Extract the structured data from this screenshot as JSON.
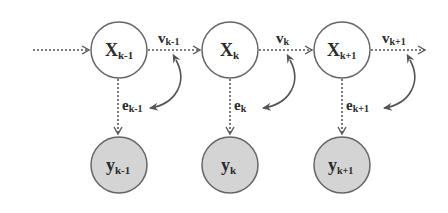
{
  "diagram": {
    "type": "state-space chain",
    "colors": {
      "background": "#ffffff",
      "stroke": "#555555",
      "text": "#2a2a2a",
      "observed_fill": "#d4d4d4",
      "state_fill": "#ffffff"
    },
    "state_nodes": [
      {
        "id": "x_km1",
        "base": "X",
        "sub": "k-1"
      },
      {
        "id": "x_k",
        "base": "X",
        "sub": "k"
      },
      {
        "id": "x_kp1",
        "base": "X",
        "sub": "k+1"
      }
    ],
    "observation_nodes": [
      {
        "id": "y_km1",
        "base": "y",
        "sub": "k-1"
      },
      {
        "id": "y_k",
        "base": "y",
        "sub": "k"
      },
      {
        "id": "y_kp1",
        "base": "y",
        "sub": "k+1"
      }
    ],
    "process_noise_labels": [
      {
        "base": "v",
        "sub": "k-1"
      },
      {
        "base": "v",
        "sub": "k"
      },
      {
        "base": "v",
        "sub": "k+1"
      }
    ],
    "measurement_noise_labels": [
      {
        "base": "e",
        "sub": "k-1"
      },
      {
        "base": "e",
        "sub": "k"
      },
      {
        "base": "e",
        "sub": "k+1"
      }
    ],
    "edges": [
      {
        "from": "input",
        "to": "x_km1",
        "style": "dotted-arrow"
      },
      {
        "from": "x_km1",
        "to": "x_k",
        "style": "dotted-arrow",
        "label": "v_k-1"
      },
      {
        "from": "x_k",
        "to": "x_kp1",
        "style": "dotted-arrow",
        "label": "v_k"
      },
      {
        "from": "x_kp1",
        "to": "output",
        "style": "dotted-arrow",
        "label": "v_k+1"
      },
      {
        "from": "x_km1",
        "to": "y_km1",
        "style": "dotted-arrow",
        "label": "e_k-1"
      },
      {
        "from": "x_k",
        "to": "y_k",
        "style": "dotted-arrow",
        "label": "e_k"
      },
      {
        "from": "x_kp1",
        "to": "y_kp1",
        "style": "dotted-arrow",
        "label": "e_k+1"
      },
      {
        "from": "v_k-1",
        "to": "e_k-1",
        "style": "curved-double-arrow"
      },
      {
        "from": "v_k",
        "to": "e_k",
        "style": "curved-double-arrow"
      },
      {
        "from": "v_k+1",
        "to": "e_k+1",
        "style": "curved-double-arrow"
      }
    ]
  }
}
